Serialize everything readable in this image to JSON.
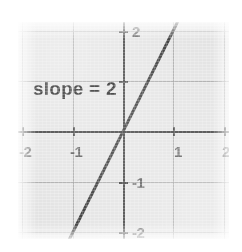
{
  "chart_data": {
    "type": "line",
    "title": "",
    "subtitle": "",
    "xlabel": "",
    "ylabel": "",
    "xlim": [
      -2.1,
      2.1
    ],
    "ylim": [
      -2.15,
      2.15
    ],
    "grid": true,
    "legend": "none",
    "annotations": [
      {
        "text": "slope = 2",
        "x": -1.45,
        "y": 1.0
      }
    ],
    "x_ticks": [
      {
        "value": -2,
        "label": "-2"
      },
      {
        "value": -1,
        "label": "-1"
      },
      {
        "value": 1,
        "label": "1"
      },
      {
        "value": 2,
        "label": "2"
      }
    ],
    "y_ticks": [
      {
        "value": 2,
        "label": "2"
      },
      {
        "value": 1,
        "label": ""
      },
      {
        "value": -1,
        "label": "-1"
      },
      {
        "value": -2,
        "label": "-2"
      }
    ],
    "series": [
      {
        "name": "y = 2x",
        "slope": 2,
        "intercept": 0,
        "points": [
          [
            -1.1,
            -2.2
          ],
          [
            1.1,
            2.2
          ]
        ],
        "color": "#333333"
      }
    ],
    "colors": {
      "panel_background": "#e3e3e3",
      "gridline": "#9a9a9a",
      "axis": "#3d3d3d",
      "line": "#333333",
      "annotation_text": "#1a1a1a",
      "tick_label": "#585858",
      "page_background": "#ffffff"
    }
  }
}
